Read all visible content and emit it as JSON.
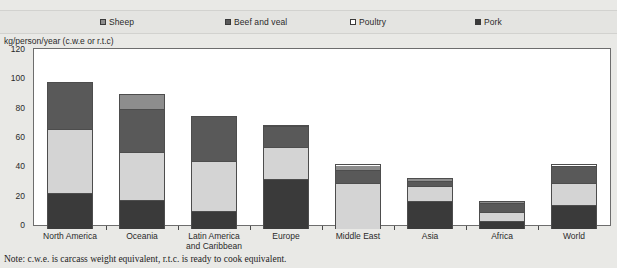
{
  "legend": {
    "items": [
      {
        "label": "Sheep",
        "color": "#8d8d8d",
        "icon": "legend-swatch-sheep"
      },
      {
        "label": "Beef and veal",
        "color": "#595959",
        "icon": "legend-swatch-beef"
      },
      {
        "label": "Poultry",
        "color": "#ffffff",
        "icon": "legend-swatch-poultry"
      },
      {
        "label": "Pork",
        "color": "#3a3a3a",
        "icon": "legend-swatch-pork"
      }
    ],
    "position": "top"
  },
  "axis_title": "kg/person/year (c.w.e or r.t.c)",
  "note": "Note:  c.w.e. is carcass weight equivalent, r.t.c. is ready to cook equivalent.",
  "chart_data": {
    "type": "bar",
    "stacked": true,
    "title": "",
    "subtitle": "",
    "xlabel": "",
    "ylabel": "kg/person/year (c.w.e or r.t.c)",
    "ylim": [
      0,
      120
    ],
    "yticks": [
      0,
      20,
      40,
      60,
      80,
      100,
      120
    ],
    "grid": false,
    "legend_position": "top",
    "categories": [
      "North America",
      "Oceania",
      "Latin America and Caribbean",
      "Europe",
      "Middle East",
      "Asia",
      "Africa",
      "World"
    ],
    "series": [
      {
        "name": "Pork",
        "color": "#3a3a3a",
        "values": [
          24,
          19,
          12,
          34,
          0,
          19,
          5,
          16
        ]
      },
      {
        "name": "Poultry",
        "color": "#d4d4d4",
        "values": [
          44,
          33,
          34,
          22,
          31,
          10,
          6,
          15
        ]
      },
      {
        "name": "Beef and veal",
        "color": "#595959",
        "values": [
          32,
          30,
          31,
          14,
          9,
          4,
          6.5,
          12
        ]
      },
      {
        "name": "Sheep",
        "color": "#8d8d8d",
        "values": [
          0,
          10,
          0,
          1,
          4,
          2,
          1.5,
          1
        ]
      }
    ],
    "totals": [
      100,
      92,
      77,
      71,
      44,
      35,
      19,
      44
    ]
  }
}
